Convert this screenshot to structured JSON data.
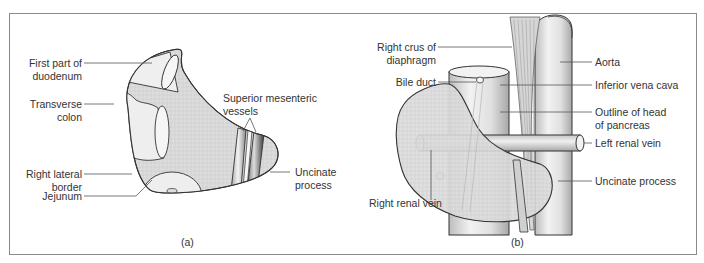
{
  "figure": {
    "panels": [
      {
        "id": "a",
        "caption": "(a)",
        "labels": {
          "first_part_duodenum": [
            "First part of",
            "duodenum"
          ],
          "transverse_colon": [
            "Transverse",
            "colon"
          ],
          "right_lateral_border": [
            "Right lateral",
            "border"
          ],
          "jejunum": "Jejunum",
          "superior_mesenteric_vessels": [
            "Superior mesenteric",
            "vessels"
          ],
          "uncinate_process": [
            "Uncinate",
            "process"
          ]
        }
      },
      {
        "id": "b",
        "caption": "(b)",
        "labels": {
          "right_crus": [
            "Right crus of",
            "diaphragm"
          ],
          "bile_duct": "Bile duct",
          "right_renal_vein": "Right renal vein",
          "aorta": "Aorta",
          "inferior_vena_cava": "Inferior vena cava",
          "outline_head_pancreas": [
            "Outline of head",
            "of pancreas"
          ],
          "left_renal_vein": "Left renal vein",
          "uncinate_process": "Uncinate process"
        }
      }
    ],
    "colors": {
      "pancreas_fill": "#d9d9d9",
      "vessel_fill": "#e6e6e6",
      "outline": "#333333",
      "leader": "#555555",
      "frame": "#8a8a8a"
    }
  }
}
